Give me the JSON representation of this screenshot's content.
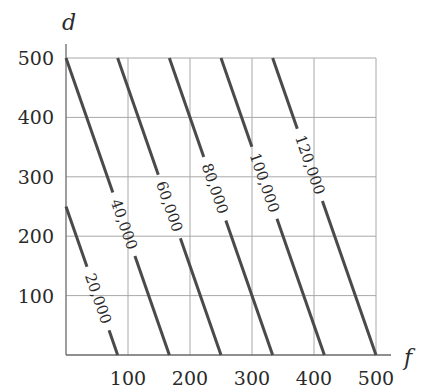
{
  "chart_data": {
    "type": "line",
    "title": "",
    "xlabel": "f",
    "ylabel": "d",
    "xlim": [
      0,
      500
    ],
    "ylim": [
      0,
      500
    ],
    "grid": true,
    "x_ticks": [
      100,
      200,
      300,
      400,
      500
    ],
    "y_ticks": [
      100,
      200,
      300,
      400,
      500
    ],
    "x_tick_labels": [
      "100",
      "200",
      "300",
      "400",
      "500"
    ],
    "y_tick_labels": [
      "100",
      "200",
      "300",
      "400",
      "500"
    ],
    "series": [
      {
        "name": "20,000",
        "label": "20,000",
        "value": 20000,
        "points": [
          [
            0,
            250
          ],
          [
            83.3,
            0
          ]
        ]
      },
      {
        "name": "40,000",
        "label": "40,000",
        "value": 40000,
        "points": [
          [
            0,
            500
          ],
          [
            166.7,
            0
          ]
        ]
      },
      {
        "name": "60,000",
        "label": "60,000",
        "value": 60000,
        "points": [
          [
            83.3,
            500
          ],
          [
            250,
            0
          ]
        ]
      },
      {
        "name": "80,000",
        "label": "80,000",
        "value": 80000,
        "points": [
          [
            166.7,
            500
          ],
          [
            333.3,
            0
          ]
        ]
      },
      {
        "name": "100,000",
        "label": "100,000",
        "value": 100000,
        "points": [
          [
            250,
            500
          ],
          [
            416.7,
            0
          ]
        ]
      },
      {
        "name": "120,000",
        "label": "120,000",
        "value": 120000,
        "points": [
          [
            333.3,
            500
          ],
          [
            500,
            0
          ]
        ]
      }
    ],
    "legend": "none (inline contour labels)"
  }
}
